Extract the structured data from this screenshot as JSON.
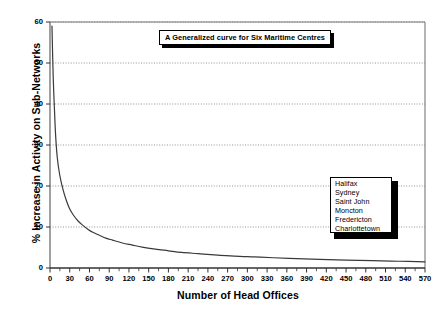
{
  "chart_data": {
    "type": "line",
    "title": "A Generalized curve for Six Maritime Centres",
    "xlabel": "Number of Head Offices",
    "ylabel": "% Increase in Activity on Sub-Networks",
    "xlim": [
      0,
      570
    ],
    "ylim": [
      0,
      60
    ],
    "grid": "horizontal-dotted",
    "legend_position": "inside-right",
    "legend": [
      "Halifax",
      "Sydney",
      "Saint John",
      "Moncton",
      "Fredericton",
      "Charlottetown"
    ],
    "xticks": [
      0,
      30,
      60,
      90,
      120,
      150,
      180,
      210,
      240,
      270,
      300,
      330,
      360,
      390,
      420,
      450,
      480,
      510,
      540,
      570
    ],
    "yticks": [
      0,
      10,
      20,
      30,
      40,
      50,
      60
    ],
    "xtick_labels": [
      "0",
      "30",
      "60",
      "90",
      "120",
      "150",
      "180",
      "210",
      "240",
      "270",
      "300",
      "330",
      "360",
      "390",
      "420",
      "450",
      "480",
      "510",
      "540",
      "570"
    ],
    "ytick_labels": [
      "0",
      "10",
      "20",
      "30",
      "40",
      "50",
      "60"
    ],
    "series": [
      {
        "name": "Generalized curve",
        "x": [
          3,
          5,
          8,
          11,
          15,
          20,
          25,
          30,
          36,
          43,
          50,
          58,
          65,
          75,
          85,
          95,
          110,
          125,
          140,
          160,
          180,
          200,
          225,
          250,
          280,
          310,
          340,
          375,
          410,
          450,
          490,
          530,
          570
        ],
        "y": [
          59.0,
          46.0,
          34.0,
          27.0,
          22.5,
          19.0,
          16.4,
          14.4,
          12.8,
          11.4,
          10.4,
          9.4,
          8.7,
          8.0,
          7.3,
          6.8,
          6.1,
          5.6,
          5.1,
          4.6,
          4.2,
          3.8,
          3.5,
          3.2,
          2.9,
          2.7,
          2.5,
          2.3,
          2.1,
          1.9,
          1.8,
          1.65,
          1.5
        ]
      }
    ],
    "colors": {
      "curve": "#3a3a3a",
      "axis": "#555555",
      "gridline": "#888888",
      "background": "#ffffff",
      "box_border": "#000000",
      "box_shadow": "#000000"
    }
  }
}
